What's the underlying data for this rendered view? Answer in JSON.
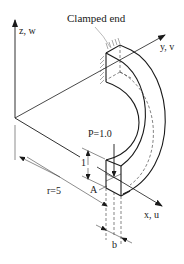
{
  "figure": {
    "type": "curved cantilever beam (quarter circle) under tip load",
    "labels": {
      "clamped_end": "Clamped end",
      "z_axis": "z, w",
      "y_axis": "y, v",
      "x_axis": "x, u",
      "load": "P=1.0",
      "point": "A",
      "radius": "r=5",
      "height": "1",
      "width": "b"
    },
    "colors": {
      "line": "#1a1a1a",
      "hatch": "#555555",
      "dashed": "#333333",
      "background": "#ffffff"
    }
  }
}
